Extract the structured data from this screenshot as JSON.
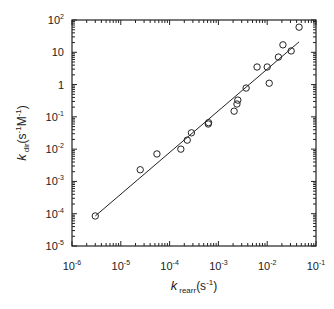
{
  "chart_data": {
    "type": "scatter",
    "title": "",
    "xlabel": "k rearr (s-1)",
    "ylabel": "k dir (s-1 M-1)",
    "xlabel_parts": {
      "main": "k",
      "sub": "rearr",
      "unit": "(s",
      "unit_sup": "-1",
      "unit_end": ")"
    },
    "ylabel_parts": {
      "main": "k",
      "sub": "dir",
      "unit": "(s",
      "unit_sup1": "-1",
      "unit_mid": "M",
      "unit_sup2": "-1",
      "unit_end": ")"
    },
    "xscale": "log",
    "yscale": "log",
    "xlim": [
      1e-06,
      0.1
    ],
    "ylim": [
      1e-05,
      100.0
    ],
    "grid": false,
    "legend": null,
    "x_ticks": [
      {
        "value": 1e-06,
        "base": "10",
        "exp": "-6"
      },
      {
        "value": 1e-05,
        "base": "10",
        "exp": "-5"
      },
      {
        "value": 0.0001,
        "base": "10",
        "exp": "-4"
      },
      {
        "value": 0.001,
        "base": "10",
        "exp": "-3"
      },
      {
        "value": 0.01,
        "base": "10",
        "exp": "-2"
      },
      {
        "value": 0.1,
        "base": "10",
        "exp": "-1"
      }
    ],
    "y_ticks": [
      {
        "value": 100.0,
        "base": "10",
        "exp": "2"
      },
      {
        "value": 10,
        "base": "10",
        "exp": ""
      },
      {
        "value": 1,
        "base": "1",
        "exp": ""
      },
      {
        "value": 0.1,
        "base": "10",
        "exp": "-1"
      },
      {
        "value": 0.01,
        "base": "10",
        "exp": "-2"
      },
      {
        "value": 0.001,
        "base": "10",
        "exp": "-3"
      },
      {
        "value": 0.0001,
        "base": "10",
        "exp": "-4"
      },
      {
        "value": 1e-05,
        "base": "10",
        "exp": "-5"
      }
    ],
    "series": [
      {
        "name": "data",
        "marker": "open-circle",
        "points": [
          {
            "x": 3e-06,
            "y": 8.5e-05
          },
          {
            "x": 2.5e-05,
            "y": 0.0023
          },
          {
            "x": 5.5e-05,
            "y": 0.0071
          },
          {
            "x": 0.00017,
            "y": 0.01
          },
          {
            "x": 0.00023,
            "y": 0.019
          },
          {
            "x": 0.00028,
            "y": 0.032
          },
          {
            "x": 0.00062,
            "y": 0.06
          },
          {
            "x": 0.00063,
            "y": 0.066
          },
          {
            "x": 0.0021,
            "y": 0.15
          },
          {
            "x": 0.0024,
            "y": 0.25
          },
          {
            "x": 0.0025,
            "y": 0.33
          },
          {
            "x": 0.0037,
            "y": 0.78
          },
          {
            "x": 0.0062,
            "y": 3.5
          },
          {
            "x": 0.01,
            "y": 3.5
          },
          {
            "x": 0.011,
            "y": 1.1
          },
          {
            "x": 0.017,
            "y": 7.1
          },
          {
            "x": 0.021,
            "y": 17
          },
          {
            "x": 0.031,
            "y": 11
          },
          {
            "x": 0.045,
            "y": 60
          }
        ]
      },
      {
        "name": "fit",
        "type": "line",
        "points": [
          {
            "x": 3e-06,
            "y": 8.5e-05
          },
          {
            "x": 0.045,
            "y": 21
          }
        ]
      }
    ]
  }
}
